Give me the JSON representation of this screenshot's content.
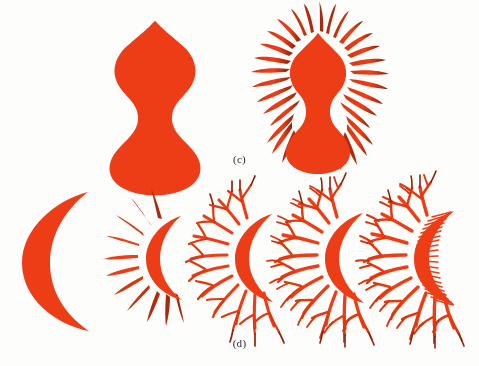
{
  "figure": {
    "type": "scanned-textbook-figure",
    "background_color": "#fdfdfc",
    "ink_color": "#ed3d17",
    "ink_color_dark": "#9e2a10",
    "caption_color": "#2a2a2a",
    "panels": [
      {
        "id": "c",
        "caption": "(c)",
        "base_shape_name": "gourd",
        "items": [
          {
            "name": "gourd-initiator",
            "iteration": 0,
            "description": "solid double-lobed gourd silhouette"
          },
          {
            "name": "gourd-fractal-rays",
            "iteration": 1,
            "description": "gourd with radiating tapered rays around the full perimeter",
            "ray_count": 34
          }
        ]
      },
      {
        "id": "d",
        "caption": "(d)",
        "base_shape_name": "crescent",
        "items": [
          {
            "name": "crescent-initiator",
            "iteration": 0,
            "description": "solid crescent moon silhouette"
          },
          {
            "name": "crescent-iteration-1",
            "iteration": 1,
            "description": "crescent with straight unbranched spikes on the convex edge",
            "spike_count": 11,
            "branch_levels": 1
          },
          {
            "name": "crescent-iteration-2",
            "iteration": 2,
            "description": "crescent with spikes that fork once",
            "spike_count": 11,
            "branch_levels": 2
          },
          {
            "name": "crescent-iteration-3",
            "iteration": 3,
            "description": "crescent with spikes that fork twice",
            "spike_count": 11,
            "branch_levels": 3
          },
          {
            "name": "crescent-iteration-4",
            "iteration": 4,
            "description": "crescent with branched spikes plus fine teeth along the concave edge",
            "spike_count": 11,
            "branch_levels": 3,
            "inner_teeth": 22
          }
        ]
      }
    ]
  }
}
